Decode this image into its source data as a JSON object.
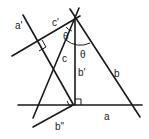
{
  "diagram": {
    "type": "geometry",
    "labels": {
      "a_prime": "a'",
      "c_prime": "c'",
      "theta_1": "θ",
      "theta_2": "θ",
      "c": "c",
      "b_prime": "b'",
      "b": "b",
      "a": "a",
      "b_double_prime": "b\""
    },
    "lines": [
      {
        "name": "a",
        "from": [
          18,
          105
        ],
        "to": [
          142,
          105
        ]
      },
      {
        "name": "b",
        "from": [
          71,
          10
        ],
        "to": [
          140,
          117
        ]
      },
      {
        "name": "c",
        "from": [
          78,
          8
        ],
        "to": [
          33,
          118
        ]
      },
      {
        "name": "b'",
        "from": [
          75,
          19
        ],
        "to": [
          75,
          105
        ]
      },
      {
        "name": "c'",
        "from": [
          12,
          56
        ],
        "to": [
          80,
          10
        ]
      },
      {
        "name": "a'",
        "from": [
          23,
          15
        ],
        "to": [
          73,
          104
        ]
      },
      {
        "name": "b''",
        "from": [
          33,
          127
        ],
        "to": [
          73,
          105
        ]
      }
    ],
    "right_angle_markers": 3,
    "angle_arcs": 2,
    "colors": {
      "stroke": "#1a1a1a",
      "background": "#ffffff"
    }
  }
}
